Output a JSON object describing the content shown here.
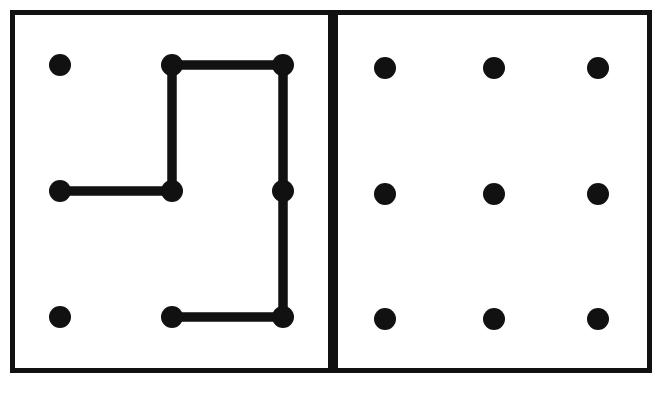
{
  "canvas": {
    "width": 669,
    "height": 396,
    "background_color": "#ffffff",
    "ink_color": "#111111"
  },
  "figure": {
    "title": "",
    "caption": "",
    "panel_count": 2
  },
  "style": {
    "frame_stroke_color": "#111111",
    "frame_stroke_width": 5,
    "frame_fill": "#ffffff",
    "dot_color": "#111111",
    "dot_radius": 11,
    "path_color": "#111111",
    "path_stroke_width": 9,
    "path_linecap": "round",
    "path_linejoin": "round"
  },
  "panels": [
    {
      "id": "left-panel",
      "name": "left-panel-with-path",
      "label": "",
      "frame": {
        "x": 10,
        "y": 10,
        "width": 323,
        "height": 363
      },
      "grid": {
        "rows": 3,
        "cols": 3,
        "col_x": [
          60,
          172,
          283
        ],
        "row_y": [
          65,
          191,
          317
        ]
      },
      "dots": [
        {
          "id": "L-r0c0",
          "name": "dot-row0-col0",
          "cx": 60,
          "cy": 65,
          "r": 11,
          "connected": false
        },
        {
          "id": "L-r0c1",
          "name": "dot-row0-col1",
          "cx": 172,
          "cy": 65,
          "r": 11,
          "connected": true
        },
        {
          "id": "L-r0c2",
          "name": "dot-row0-col2",
          "cx": 283,
          "cy": 65,
          "r": 11,
          "connected": true
        },
        {
          "id": "L-r1c0",
          "name": "dot-row1-col0",
          "cx": 60,
          "cy": 191,
          "r": 11,
          "connected": true
        },
        {
          "id": "L-r1c1",
          "name": "dot-row1-col1",
          "cx": 172,
          "cy": 191,
          "r": 11,
          "connected": true
        },
        {
          "id": "L-r1c2",
          "name": "dot-row1-col2",
          "cx": 283,
          "cy": 191,
          "r": 11,
          "connected": true
        },
        {
          "id": "L-r2c0",
          "name": "dot-row2-col0",
          "cx": 60,
          "cy": 317,
          "r": 11,
          "connected": false
        },
        {
          "id": "L-r2c1",
          "name": "dot-row2-col1",
          "cx": 172,
          "cy": 317,
          "r": 11,
          "connected": true
        },
        {
          "id": "L-r2c2",
          "name": "dot-row2-col2",
          "cx": 283,
          "cy": 317,
          "r": 11,
          "connected": true
        }
      ],
      "path": {
        "name": "connecting-path",
        "sequence": [
          "L-r1c0",
          "L-r1c1",
          "L-r0c1",
          "L-r0c2",
          "L-r1c2",
          "L-r2c2",
          "L-r2c1"
        ],
        "points": [
          [
            60,
            191
          ],
          [
            172,
            191
          ],
          [
            172,
            65
          ],
          [
            283,
            65
          ],
          [
            283,
            191
          ],
          [
            283,
            317
          ],
          [
            172,
            317
          ]
        ],
        "segments": [
          {
            "name": "segment-r1c0-to-r1c1",
            "x1": 60,
            "y1": 191,
            "x2": 172,
            "y2": 191,
            "orientation": "horizontal"
          },
          {
            "name": "segment-r1c1-to-r0c1",
            "x1": 172,
            "y1": 191,
            "x2": 172,
            "y2": 65,
            "orientation": "vertical"
          },
          {
            "name": "segment-r0c1-to-r0c2",
            "x1": 172,
            "y1": 65,
            "x2": 283,
            "y2": 65,
            "orientation": "horizontal"
          },
          {
            "name": "segment-r0c2-to-r1c2",
            "x1": 283,
            "y1": 65,
            "x2": 283,
            "y2": 191,
            "orientation": "vertical"
          },
          {
            "name": "segment-r1c2-to-r2c2",
            "x1": 283,
            "y1": 191,
            "x2": 283,
            "y2": 317,
            "orientation": "vertical"
          },
          {
            "name": "segment-r2c2-to-r2c1",
            "x1": 283,
            "y1": 317,
            "x2": 172,
            "y2": 317,
            "orientation": "horizontal"
          }
        ],
        "segment_count": 6,
        "closed": false
      }
    },
    {
      "id": "right-panel",
      "name": "right-panel-empty-grid",
      "label": "",
      "frame": {
        "x": 333,
        "y": 10,
        "width": 319,
        "height": 363
      },
      "grid": {
        "rows": 3,
        "cols": 3,
        "col_x": [
          385,
          494,
          598
        ],
        "row_y": [
          68,
          194,
          319
        ]
      },
      "dots": [
        {
          "id": "R-r0c0",
          "name": "dot-row0-col0",
          "cx": 385,
          "cy": 68,
          "r": 11,
          "connected": false
        },
        {
          "id": "R-r0c1",
          "name": "dot-row0-col1",
          "cx": 494,
          "cy": 68,
          "r": 11,
          "connected": false
        },
        {
          "id": "R-r0c2",
          "name": "dot-row0-col2",
          "cx": 598,
          "cy": 68,
          "r": 11,
          "connected": false
        },
        {
          "id": "R-r1c0",
          "name": "dot-row1-col0",
          "cx": 385,
          "cy": 194,
          "r": 11,
          "connected": false
        },
        {
          "id": "R-r1c1",
          "name": "dot-row1-col1",
          "cx": 494,
          "cy": 194,
          "r": 11,
          "connected": false
        },
        {
          "id": "R-r1c2",
          "name": "dot-row1-col2",
          "cx": 598,
          "cy": 194,
          "r": 11,
          "connected": false
        },
        {
          "id": "R-r2c0",
          "name": "dot-row2-col0",
          "cx": 385,
          "cy": 319,
          "r": 11,
          "connected": false
        },
        {
          "id": "R-r2c1",
          "name": "dot-row2-col1",
          "cx": 494,
          "cy": 319,
          "r": 11,
          "connected": false
        },
        {
          "id": "R-r2c2",
          "name": "dot-row2-col2",
          "cx": 598,
          "cy": 319,
          "r": 11,
          "connected": false
        }
      ],
      "path": {
        "name": "connecting-path",
        "sequence": [],
        "points": [],
        "segments": [],
        "segment_count": 0,
        "closed": false
      }
    }
  ]
}
